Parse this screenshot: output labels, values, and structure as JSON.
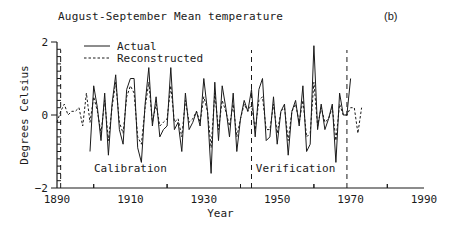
{
  "chart_data": {
    "type": "line",
    "title": "August-September Mean temperature",
    "panel_label": "(b)",
    "xlabel": "Year",
    "ylabel": "Degrees Celsius",
    "xlim": [
      1890,
      1990
    ],
    "ylim": [
      -2,
      2
    ],
    "xticks": [
      1890,
      1910,
      1930,
      1950,
      1970,
      1990
    ],
    "yticks": [
      -2,
      0,
      2
    ],
    "grid": false,
    "legend": {
      "position": "upper-left",
      "entries": [
        "Actual",
        "Reconstructed"
      ]
    },
    "annotations": [
      {
        "text": "Calibration",
        "x": 1910,
        "y": -1.45
      },
      {
        "text": "Verification",
        "x": 1955,
        "y": -1.45
      }
    ],
    "period_markers": [
      1891,
      1943,
      1969
    ],
    "series": [
      {
        "name": "Actual",
        "style": "solid",
        "x": [
          1899,
          1900,
          1901,
          1902,
          1903,
          1904,
          1905,
          1906,
          1907,
          1908,
          1909,
          1910,
          1911,
          1912,
          1913,
          1914,
          1915,
          1916,
          1917,
          1918,
          1919,
          1920,
          1921,
          1922,
          1923,
          1924,
          1925,
          1926,
          1927,
          1928,
          1929,
          1930,
          1931,
          1932,
          1933,
          1934,
          1935,
          1936,
          1937,
          1938,
          1939,
          1940,
          1941,
          1942,
          1943,
          1944,
          1945,
          1946,
          1947,
          1948,
          1949,
          1950,
          1951,
          1952,
          1953,
          1954,
          1955,
          1956,
          1957,
          1958,
          1959,
          1960,
          1961,
          1962,
          1963,
          1964,
          1965,
          1966,
          1967,
          1968,
          1969,
          1970
        ],
        "values": [
          -1.0,
          0.8,
          0.2,
          -0.7,
          0.6,
          -1.1,
          0.3,
          1.1,
          -0.4,
          -0.8,
          0.7,
          1.0,
          1.0,
          -0.9,
          -1.3,
          0.3,
          1.3,
          -0.3,
          0.5,
          -0.6,
          -0.4,
          -0.3,
          1.3,
          -0.4,
          -0.2,
          -1.0,
          0.6,
          -0.4,
          -0.2,
          0.1,
          -0.3,
          1.0,
          0.1,
          -1.6,
          0.9,
          -0.7,
          0.8,
          0.2,
          -0.6,
          0.6,
          -1.0,
          -0.1,
          0.4,
          0.1,
          0.7,
          -0.6,
          0.7,
          1.0,
          -0.7,
          -0.6,
          0.5,
          -0.8,
          0.1,
          0.3,
          -1.1,
          0.1,
          0.4,
          -0.3,
          0.8,
          -1.0,
          -0.8,
          1.9,
          -0.4,
          0.3,
          -0.4,
          -0.1,
          0.3,
          -1.3,
          0.6,
          0.0,
          0.0,
          1.0
        ]
      },
      {
        "name": "Reconstructed",
        "style": "dashed",
        "x": [
          1890,
          1891,
          1892,
          1893,
          1894,
          1895,
          1896,
          1897,
          1898,
          1899,
          1900,
          1901,
          1902,
          1903,
          1904,
          1905,
          1906,
          1907,
          1908,
          1909,
          1910,
          1911,
          1912,
          1913,
          1914,
          1915,
          1916,
          1917,
          1918,
          1919,
          1920,
          1921,
          1922,
          1923,
          1924,
          1925,
          1926,
          1927,
          1928,
          1929,
          1930,
          1931,
          1932,
          1933,
          1934,
          1935,
          1936,
          1937,
          1938,
          1939,
          1940,
          1941,
          1942,
          1943,
          1944,
          1945,
          1946,
          1947,
          1948,
          1949,
          1950,
          1951,
          1952,
          1953,
          1954,
          1955,
          1956,
          1957,
          1958,
          1959,
          1960,
          1961,
          1962,
          1963,
          1964,
          1965,
          1966,
          1967,
          1968,
          1969,
          1970,
          1971,
          1972,
          1973
        ],
        "values": [
          -0.2,
          0.1,
          0.3,
          0.0,
          0.1,
          0.1,
          0.2,
          -0.3,
          0.6,
          -0.2,
          0.5,
          0.1,
          -0.5,
          0.4,
          -0.7,
          0.2,
          0.9,
          -0.2,
          -0.5,
          0.5,
          0.8,
          0.6,
          -0.6,
          -0.8,
          0.2,
          0.9,
          -0.2,
          0.3,
          -0.3,
          -0.2,
          -0.1,
          0.8,
          -0.2,
          -0.1,
          -0.6,
          0.4,
          -0.2,
          -0.1,
          0.1,
          -0.2,
          0.5,
          0.1,
          -0.9,
          0.6,
          -0.4,
          0.4,
          0.1,
          -0.3,
          0.3,
          -0.6,
          -0.1,
          0.3,
          0.1,
          0.3,
          -0.4,
          0.4,
          0.5,
          -0.4,
          -0.4,
          0.3,
          -0.5,
          0.1,
          0.2,
          -0.7,
          0.1,
          0.3,
          -0.2,
          0.4,
          -0.6,
          -0.5,
          0.9,
          -0.3,
          0.2,
          -0.2,
          -0.1,
          0.2,
          -0.7,
          0.3,
          0.0,
          0.0,
          0.2,
          0.2,
          -0.5,
          0.2
        ]
      }
    ]
  }
}
